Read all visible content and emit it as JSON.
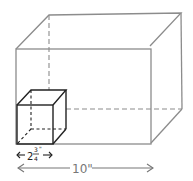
{
  "diagram": {
    "large_box": {
      "width_label": "10\"",
      "edge_color": "#8c8c8c"
    },
    "small_cube": {
      "whole": "2",
      "numerator": "3",
      "denominator": "4",
      "inch_mark": "\"",
      "edge_color": "#222222"
    }
  }
}
